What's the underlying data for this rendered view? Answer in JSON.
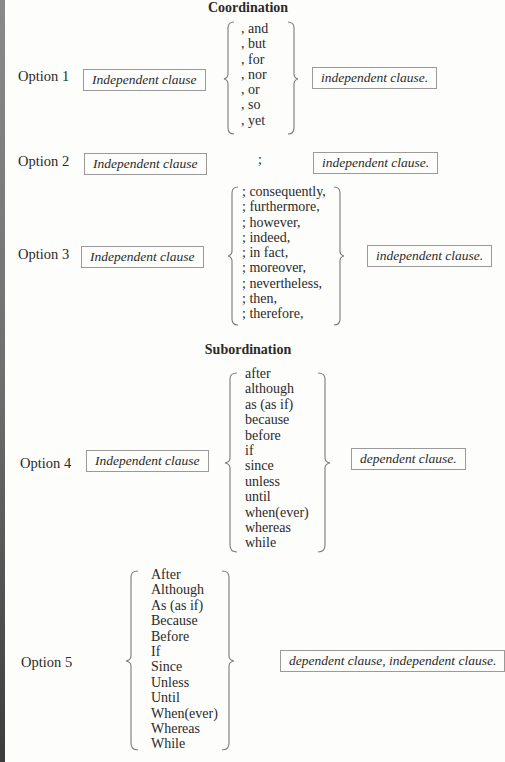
{
  "sections": {
    "coordination": {
      "title": "Coordination"
    },
    "subordination": {
      "title": "Subordination"
    }
  },
  "options": [
    {
      "label": "Option 1",
      "left_box": "Independent clause",
      "connectors": [
        ", and",
        ", but",
        ", for",
        ", nor",
        ", or",
        ", so",
        ", yet"
      ],
      "right_box": "independent clause."
    },
    {
      "label": "Option 2",
      "left_box": "Independent clause",
      "connector": ";",
      "right_box": "independent clause."
    },
    {
      "label": "Option 3",
      "left_box": "Independent clause",
      "connectors": [
        "; consequently,",
        "; furthermore,",
        "; however,",
        "; indeed,",
        "; in fact,",
        "; moreover,",
        "; nevertheless,",
        "; then,",
        "; therefore,"
      ],
      "right_box": "independent clause."
    },
    {
      "label": "Option 4",
      "left_box": "Independent clause",
      "connectors": [
        "after",
        "although",
        "as (as if)",
        "because",
        "before",
        "if",
        "since",
        "unless",
        "until",
        "when(ever)",
        "whereas",
        "while"
      ],
      "right_box": "dependent clause."
    },
    {
      "label": "Option 5",
      "connectors": [
        "After",
        "Although",
        "As (as if)",
        "Because",
        "Before",
        "If",
        "Since",
        "Unless",
        "Until",
        "When(ever)",
        "Whereas",
        "While"
      ],
      "right_box": "dependent clause, independent clause."
    }
  ]
}
